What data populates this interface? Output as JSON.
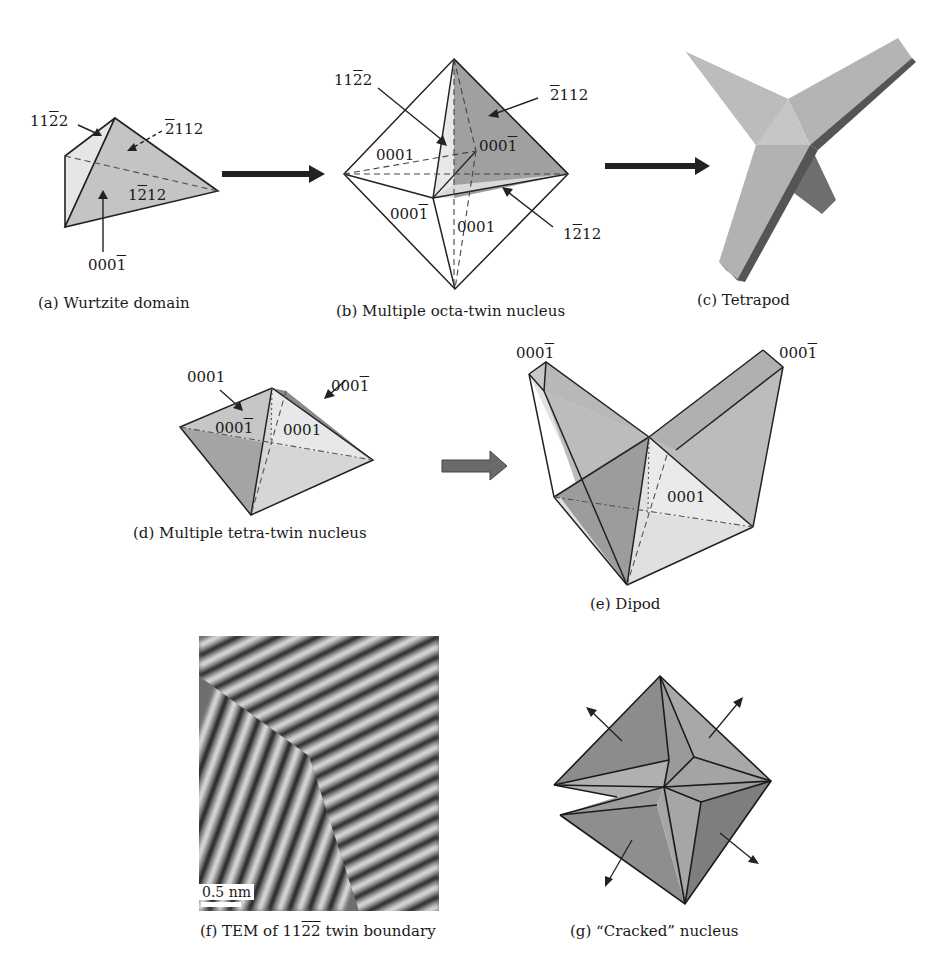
{
  "figure": {
    "colors": {
      "face_light": "#e4e4e4",
      "face_mid": "#c8c8c8",
      "face_dark": "#9a9a9a",
      "edge": "#222222",
      "arrow": "#222222",
      "block_arrow": "#6a6a6a"
    },
    "panels": {
      "a": {
        "caption": "(a) Wurtzite domain",
        "labels": [
          {
            "pre": "11",
            "bar": "2",
            "post": "2"
          },
          {
            "pre": "",
            "bar": "2",
            "post": "112"
          },
          {
            "pre": "1",
            "bar": "2",
            "post": "12"
          },
          {
            "pre": "000",
            "bar": "1",
            "post": ""
          }
        ]
      },
      "b": {
        "caption": "(b) Multiple octa-twin nucleus",
        "labels": [
          {
            "pre": "11",
            "bar": "2",
            "post": "2"
          },
          {
            "pre": "",
            "bar": "2",
            "post": "112"
          },
          {
            "pre": "0001",
            "bar": "",
            "post": ""
          },
          {
            "pre": "000",
            "bar": "1",
            "post": ""
          },
          {
            "pre": "000",
            "bar": "1",
            "post": ""
          },
          {
            "pre": "0001",
            "bar": "",
            "post": ""
          },
          {
            "pre": "1",
            "bar": "2",
            "post": "12"
          }
        ]
      },
      "c": {
        "caption": "(c) Tetrapod"
      },
      "d": {
        "caption": "(d) Multiple tetra-twin nucleus",
        "labels": [
          {
            "pre": "0001",
            "bar": "",
            "post": ""
          },
          {
            "pre": "000",
            "bar": "1",
            "post": ""
          },
          {
            "pre": "000",
            "bar": "1",
            "post": ""
          },
          {
            "pre": "0001",
            "bar": "",
            "post": ""
          }
        ]
      },
      "e": {
        "caption": "(e) Dipod",
        "labels": [
          {
            "pre": "000",
            "bar": "1",
            "post": ""
          },
          {
            "pre": "000",
            "bar": "1",
            "post": ""
          },
          {
            "pre": "0001",
            "bar": "",
            "post": ""
          }
        ]
      },
      "f": {
        "caption_pre": "(f) TEM of 11",
        "caption_bar": "22",
        "caption_post": " twin boundary",
        "scale_bar": "0.5 nm"
      },
      "g": {
        "caption": "(g) “Cracked” nucleus"
      }
    }
  }
}
